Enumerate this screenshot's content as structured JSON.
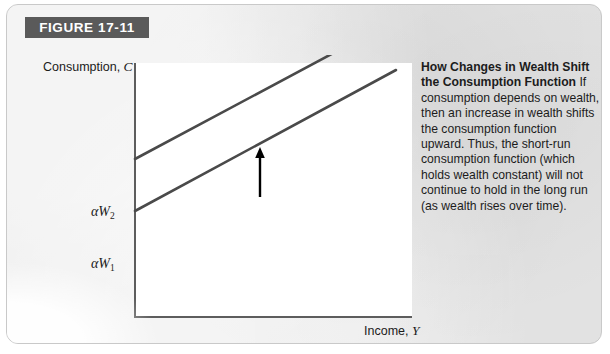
{
  "figure": {
    "banner_label": "FIGURE 17-11"
  },
  "caption": {
    "heading": "How Changes in Wealth Shift the Consumption Function",
    "body": " If consumption depends on wealth, then an increase in wealth shifts the consumption function upward. Thus, the short-run consumption function (which holds wealth constant) will not continue to hold in the long run (as wealth rises over time)."
  },
  "axes": {
    "y_label_text": "Consumption, ",
    "y_label_symbol": "C",
    "x_label_text": "Income, ",
    "x_label_symbol": "Y"
  },
  "intercepts": {
    "upper_symbol": "αW",
    "upper_subscript": "2",
    "lower_symbol": "αW",
    "lower_subscript": "1"
  },
  "colors": {
    "card_background": "#e9e9e9",
    "banner_background": "#5a5a5a",
    "banner_text": "#ffffff",
    "plot_background": "#ffffff",
    "axis_line": "#5d5d5d",
    "function_line": "#4a4a4a",
    "arrow": "#000000",
    "text": "#1c1c1c"
  },
  "chart_data": {
    "type": "line",
    "title": "How Changes in Wealth Shift the Consumption Function",
    "xlabel": "Income, Y",
    "ylabel": "Consumption, C",
    "grid": false,
    "legend": null,
    "axis_ticks": {
      "y": [
        "αW₁",
        "αW₂"
      ],
      "x": []
    },
    "series": [
      {
        "name": "Consumption function (higher wealth, αW₂)",
        "intercept_label": "αW₂",
        "points": [
          [
            0,
            158
          ],
          [
            264,
            299
          ]
        ]
      },
      {
        "name": "Consumption function (lower wealth, αW₁)",
        "intercept_label": "αW₁",
        "points": [
          [
            0,
            106
          ],
          [
            261,
            247
          ]
        ]
      }
    ],
    "annotations": [
      {
        "type": "arrow",
        "direction": "up",
        "meaning": "upward shift of the consumption function",
        "x": 132,
        "y_start": 142,
        "y_end": 94
      }
    ]
  }
}
